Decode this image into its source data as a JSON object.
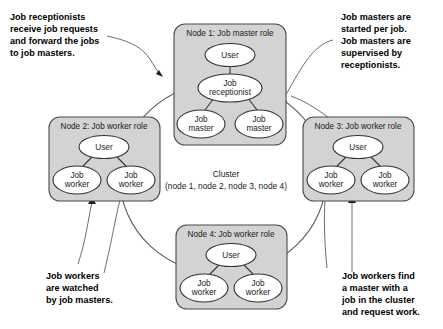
{
  "diagram": {
    "colors": {
      "node_fill": "#d3d3d3",
      "node_stroke": "#4a4a4a",
      "ellipse_fill": "#ffffff",
      "ellipse_stroke": "#333333",
      "ring_stroke": "#5c5c5c",
      "text": "#1a1a1a",
      "background": "#ffffff"
    },
    "center": {
      "label": "Cluster",
      "sublabel": "(node 1, node 2, node 3, node 4)"
    },
    "nodes": [
      {
        "id": "node1",
        "title": "Node 1: Job master role",
        "items": [
          {
            "id": "node1-user",
            "label": "User"
          },
          {
            "id": "node1-receptionist",
            "label_line1": "Job",
            "label_line2": "receptionist"
          },
          {
            "id": "node1-master-left",
            "label_line1": "Job",
            "label_line2": "master"
          },
          {
            "id": "node1-master-right",
            "label_line1": "Job",
            "label_line2": "master"
          }
        ]
      },
      {
        "id": "node2",
        "title": "Node 2: Job worker role",
        "items": [
          {
            "id": "node2-user",
            "label": "User"
          },
          {
            "id": "node2-worker-left",
            "label_line1": "Job",
            "label_line2": "worker"
          },
          {
            "id": "node2-worker-right",
            "label_line1": "Job",
            "label_line2": "worker"
          }
        ]
      },
      {
        "id": "node3",
        "title": "Node 3: Job worker role",
        "items": [
          {
            "id": "node3-user",
            "label": "User"
          },
          {
            "id": "node3-worker-left",
            "label_line1": "Job",
            "label_line2": "worker"
          },
          {
            "id": "node3-worker-right",
            "label_line1": "Job",
            "label_line2": "worker"
          }
        ]
      },
      {
        "id": "node4",
        "title": "Node 4: Job worker role",
        "items": [
          {
            "id": "node4-user",
            "label": "User"
          },
          {
            "id": "node4-worker-left",
            "label_line1": "Job",
            "label_line2": "worker"
          },
          {
            "id": "node4-worker-right",
            "label_line1": "Job",
            "label_line2": "worker"
          }
        ]
      }
    ],
    "callouts": [
      {
        "id": "callout-top-left",
        "position": "top-left",
        "lines": [
          "Job receptionists",
          "receive job requests",
          "and forward the jobs",
          "to job masters."
        ]
      },
      {
        "id": "callout-top-right",
        "position": "top-right",
        "lines": [
          "Job masters are",
          "started per job.",
          "Job masters are",
          "supervised by",
          "receptionists."
        ]
      },
      {
        "id": "callout-bottom-left",
        "position": "bottom-left",
        "lines": [
          "Job workers",
          "are watched",
          "by job masters."
        ]
      },
      {
        "id": "callout-bottom-right",
        "position": "bottom-right",
        "lines": [
          "Job workers find",
          "a master with a",
          "job in the cluster",
          "and request work."
        ]
      }
    ]
  }
}
